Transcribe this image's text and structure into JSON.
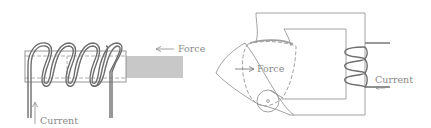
{
  "diagram": {
    "left_panel": {
      "name": "solenoid-plunger",
      "force_label": "Force",
      "current_label": "Current",
      "coil_turns": 5
    },
    "right_panel": {
      "name": "clapper-armature-relay",
      "force_label": "Force",
      "current_label": "Current",
      "coil_turns": 4
    },
    "colors": {
      "line": "#7a7a7a",
      "coil": "#6e6e6e",
      "plunger_fill": "#c8c8c8",
      "text": "#8a8a8a"
    }
  }
}
